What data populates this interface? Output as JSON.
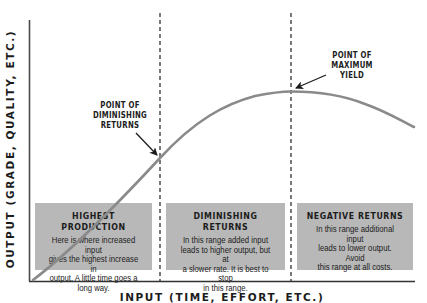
{
  "chart": {
    "type": "diminishing-returns-curve",
    "y_axis_label": "OUTPUT (GRADE, QUALITY, ETC.)",
    "x_axis_label": "INPUT (TIME, EFFORT, ETC.)",
    "colors": {
      "curve": "#8a8a8a",
      "box_fill": "#b8b8b8",
      "axis": "#333333",
      "divider": "#222222",
      "text": "#1c1c1c"
    }
  },
  "annotations": {
    "diminishing": [
      "POINT OF",
      "DIMINISHING",
      "RETURNS"
    ],
    "maximum": [
      "POINT OF",
      "MAXIMUM",
      "YIELD"
    ]
  },
  "regions": [
    {
      "title": "HIGHEST PRODUCTION",
      "body": [
        "Here is where increased input",
        "gives the highest increase in",
        "output. A little time goes a",
        "long way."
      ]
    },
    {
      "title": "DIMINISHING RETURNS",
      "body": [
        "In this range added input",
        "leads to higher output, but at",
        "a slower rate. It is best to stop",
        "in this range."
      ]
    },
    {
      "title": "NEGATIVE RETURNS",
      "body": [
        "In this range additional input",
        "leads to lower output. Avoid",
        "this range at all costs."
      ]
    }
  ]
}
